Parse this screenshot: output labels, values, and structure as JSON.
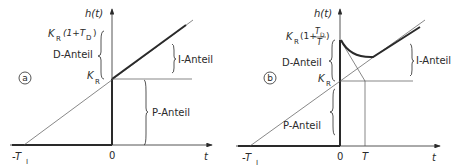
{
  "panels": [
    {
      "id": "a",
      "marker": "a",
      "y_axis_label": "h(t)",
      "x_axis_label": "t",
      "x_ticks": {
        "neg_ti": "-T",
        "neg_ti_sub": "I",
        "zero": "0"
      },
      "kr_label": "K",
      "kr_sub": "R",
      "top_label": {
        "k": "K",
        "sub": "R",
        "rest_open": "(1+T",
        "td_sub": "D",
        "rest_close": ")"
      },
      "d_anteil": "D-Anteil",
      "i_anteil": "I-Anteil",
      "p_anteil": "P-Anteil"
    },
    {
      "id": "b",
      "marker": "b",
      "y_axis_label": "h(t)",
      "x_axis_label": "t",
      "x_ticks": {
        "neg_ti": "-T",
        "neg_ti_sub": "I",
        "zero": "0",
        "T": "T"
      },
      "kr_label": "K",
      "kr_sub": "R",
      "top_label": {
        "k": "K",
        "sub": "R",
        "rest_open": "(1+",
        "frac_num": "T",
        "frac_num_sub": "D",
        "frac_den": "T",
        "rest_close": ")"
      },
      "d_anteil": "D-Anteil",
      "i_anteil": "I-Anteil",
      "p_anteil": "P-Anteil"
    }
  ],
  "colors": {
    "ink": "#2a2a2a",
    "thin": "#555555",
    "background": "#ffffff"
  }
}
